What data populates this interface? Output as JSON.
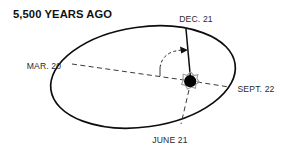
{
  "figure": {
    "title": "5,500 YEARS AGO",
    "width": 289,
    "height": 156,
    "background_color": "#ffffff",
    "line_color": "#0d0d0d",
    "dash_color": "#3a3a3a",
    "sun_color": "#000000",
    "halo_color": "#9a9a9a"
  },
  "orbit": {
    "shape": "ellipse",
    "center_x": 143,
    "center_y": 77,
    "radius_x": 93,
    "radius_y": 50,
    "rotation_deg": -8
  },
  "sun": {
    "label": "sun",
    "x": 190,
    "y": 81,
    "radius": 6.2,
    "halo_radius": 9.4
  },
  "season_points": [
    {
      "id": "dec-21",
      "label": "DEC. 21",
      "label_x": 196,
      "label_y": 22,
      "anchor": "middle",
      "line_style": "solid",
      "role": "winter-solstice"
    },
    {
      "id": "mar-20",
      "label": "MAR. 20",
      "label_x": 44,
      "label_y": 69,
      "anchor": "middle",
      "line_style": "dashed",
      "role": "spring-equinox"
    },
    {
      "id": "sept-22",
      "label": "SEPT. 22",
      "label_x": 256,
      "label_y": 92,
      "anchor": "middle",
      "line_style": "dashed",
      "role": "autumn-equinox"
    },
    {
      "id": "june-21",
      "label": "JUNE 21",
      "label_x": 170,
      "label_y": 143,
      "anchor": "middle",
      "line_style": "dashed",
      "role": "summer-solstice"
    }
  ],
  "annotations": {
    "tilt_axis": {
      "name": "axial-tilt-axis",
      "from_x": 190,
      "from_y": 81,
      "to_x": 188,
      "to_y": 30
    },
    "angle_arc": {
      "name": "obliquity-angle-arc",
      "description": "dashed arc with arrowhead indicating axial tilt angle"
    },
    "reference_line": {
      "name": "vertical-reference-line",
      "description": "short dashed vertical reference from equinox axis"
    }
  }
}
